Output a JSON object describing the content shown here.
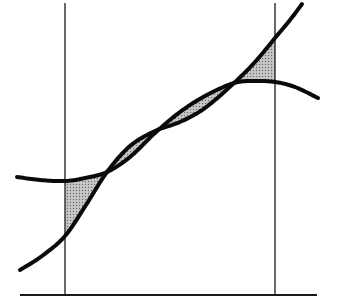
{
  "diagram": {
    "title": "",
    "colors": {
      "stroke": "#0a0a0a",
      "shade_fill": "#c8c8c8",
      "shade_dot": "#6a6a6a",
      "background": "#ffffff"
    },
    "bounds": {
      "a_label": "",
      "b_label": ""
    },
    "curves": {
      "f": {
        "name": "flat-hump-curve",
        "points": [
          [
            17,
            177
          ],
          [
            40,
            180
          ],
          [
            65,
            181
          ],
          [
            85,
            178
          ],
          [
            107,
            172
          ],
          [
            130,
            157
          ],
          [
            155,
            133
          ],
          [
            180,
            112
          ],
          [
            205,
            96
          ],
          [
            234,
            83
          ],
          [
            255,
            81
          ],
          [
            275,
            82
          ],
          [
            295,
            87
          ],
          [
            318,
            98
          ]
        ]
      },
      "g": {
        "name": "steep-s-curve",
        "points": [
          [
            20,
            270
          ],
          [
            42,
            256
          ],
          [
            65,
            236
          ],
          [
            86,
            205
          ],
          [
            107,
            172
          ],
          [
            130,
            146
          ],
          [
            155,
            131
          ],
          [
            180,
            122
          ],
          [
            205,
            108
          ],
          [
            234,
            83
          ],
          [
            255,
            62
          ],
          [
            275,
            38
          ],
          [
            290,
            20
          ],
          [
            302,
            4
          ]
        ]
      }
    },
    "verticals": {
      "left": 65,
      "right": 275
    },
    "baseline": {
      "from": 20,
      "to": 317
    },
    "intersections": [
      [
        107,
        172
      ],
      [
        234,
        83
      ]
    ]
  }
}
